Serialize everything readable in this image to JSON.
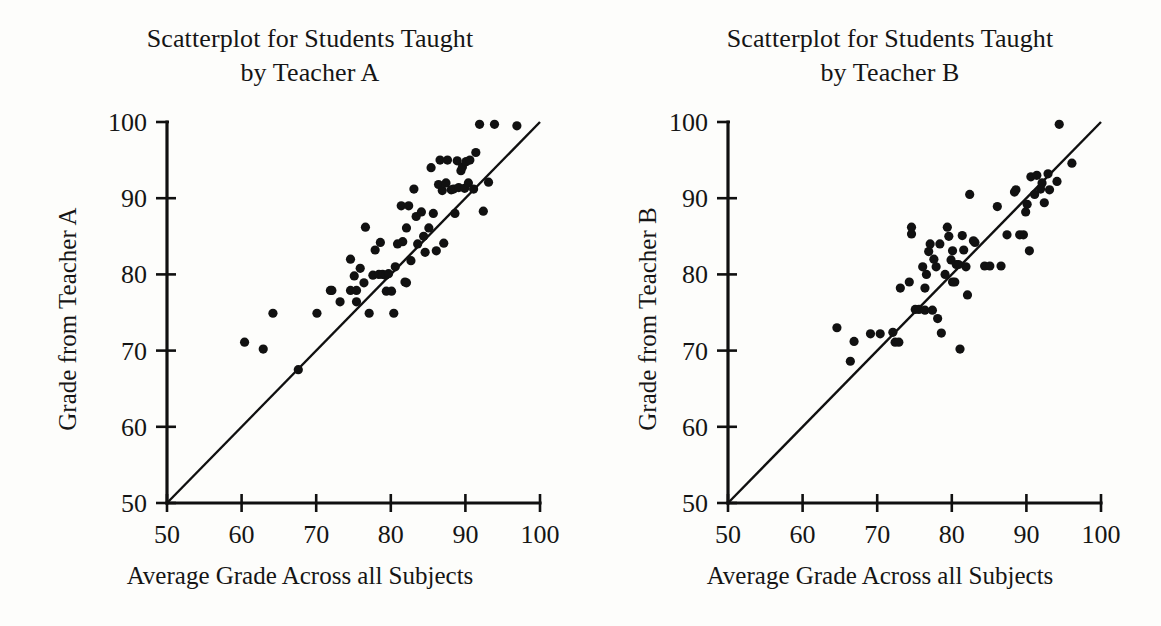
{
  "figure": {
    "background_color": "#fdfdfb",
    "ink_color": "#111111"
  },
  "panels": [
    {
      "id": "teacher-a",
      "title_line1": "Scatterplot for Students Taught",
      "title_line2": "by Teacher A",
      "xlabel": "Average Grade Across all Subjects",
      "ylabel": "Grade from Teacher A"
    },
    {
      "id": "teacher-b",
      "title_line1": "Scatterplot for Students Taught",
      "title_line2": "by Teacher B",
      "xlabel": "Average Grade Across all Subjects",
      "ylabel": "Grade from Teacher B"
    }
  ],
  "chart_data": [
    {
      "type": "scatter",
      "title": "Scatterplot for Students Taught by Teacher A",
      "xlabel": "Average Grade Across all Subjects",
      "ylabel": "Grade from Teacher A",
      "xlim": [
        50,
        100
      ],
      "ylim": [
        50,
        100
      ],
      "xticks": [
        50,
        60,
        70,
        80,
        90,
        100
      ],
      "yticks": [
        50,
        60,
        70,
        80,
        90,
        100
      ],
      "xticklabels": [
        "50",
        "60",
        "70",
        "80",
        "90",
        "100"
      ],
      "yticklabels": [
        "50",
        "60",
        "70",
        "80",
        "90",
        "100"
      ],
      "grid": false,
      "legend": false,
      "reference_line": {
        "label": "y = x identity line",
        "from": [
          50,
          50
        ],
        "to": [
          100,
          100
        ]
      },
      "points": [
        [
          60.4,
          71.1
        ],
        [
          62.9,
          70.2
        ],
        [
          64.2,
          74.9
        ],
        [
          67.6,
          67.5
        ],
        [
          70.1,
          74.9
        ],
        [
          72.1,
          77.9
        ],
        [
          73.2,
          76.4
        ],
        [
          74.6,
          77.9
        ],
        [
          74.6,
          82.0
        ],
        [
          75.4,
          77.9
        ],
        [
          75.4,
          76.4
        ],
        [
          75.9,
          80.8
        ],
        [
          76.4,
          78.9
        ],
        [
          76.6,
          86.2
        ],
        [
          77.1,
          74.9
        ],
        [
          77.6,
          79.9
        ],
        [
          77.9,
          83.2
        ],
        [
          78.4,
          80.0
        ],
        [
          78.6,
          84.2
        ],
        [
          78.9,
          80.0
        ],
        [
          79.3,
          79.9
        ],
        [
          79.4,
          77.8
        ],
        [
          79.7,
          80.1
        ],
        [
          80.1,
          77.8
        ],
        [
          80.4,
          74.9
        ],
        [
          80.6,
          81.0
        ],
        [
          81.4,
          89.0
        ],
        [
          81.6,
          84.3
        ],
        [
          81.9,
          79.0
        ],
        [
          82.1,
          86.1
        ],
        [
          82.4,
          89.0
        ],
        [
          82.7,
          81.8
        ],
        [
          83.1,
          91.2
        ],
        [
          83.4,
          87.6
        ],
        [
          83.6,
          84.0
        ],
        [
          84.1,
          88.2
        ],
        [
          84.4,
          85.0
        ],
        [
          84.6,
          82.9
        ],
        [
          85.1,
          86.1
        ],
        [
          85.4,
          94.0
        ],
        [
          85.7,
          88.0
        ],
        [
          86.1,
          83.1
        ],
        [
          86.4,
          91.8
        ],
        [
          86.6,
          95.0
        ],
        [
          86.9,
          91.0
        ],
        [
          87.1,
          84.1
        ],
        [
          87.4,
          92.0
        ],
        [
          87.6,
          95.0
        ],
        [
          88.1,
          91.1
        ],
        [
          88.4,
          91.2
        ],
        [
          88.6,
          88.0
        ],
        [
          88.9,
          94.9
        ],
        [
          89.1,
          91.4
        ],
        [
          89.4,
          93.6
        ],
        [
          89.6,
          94.1
        ],
        [
          89.9,
          91.3
        ],
        [
          90.1,
          94.8
        ],
        [
          90.4,
          92.0
        ],
        [
          90.6,
          95.0
        ],
        [
          91.1,
          91.2
        ],
        [
          91.4,
          96.0
        ],
        [
          91.9,
          99.7
        ],
        [
          92.4,
          88.3
        ],
        [
          93.1,
          92.1
        ],
        [
          93.9,
          99.7
        ],
        [
          96.9,
          99.5
        ],
        [
          82.1,
          78.9
        ],
        [
          80.9,
          84.0
        ],
        [
          75.1,
          79.8
        ],
        [
          71.9,
          77.9
        ]
      ]
    },
    {
      "type": "scatter",
      "title": "Scatterplot for Students Taught by Teacher B",
      "xlabel": "Average Grade Across all Subjects",
      "ylabel": "Grade from Teacher B",
      "xlim": [
        50,
        100
      ],
      "ylim": [
        50,
        100
      ],
      "xticks": [
        50,
        60,
        70,
        80,
        90,
        100
      ],
      "yticks": [
        50,
        60,
        70,
        80,
        90,
        100
      ],
      "xticklabels": [
        "50",
        "60",
        "70",
        "80",
        "90",
        "100"
      ],
      "yticklabels": [
        "50",
        "60",
        "70",
        "80",
        "90",
        "100"
      ],
      "grid": false,
      "legend": false,
      "reference_line": {
        "label": "y = x identity line",
        "from": [
          50,
          50
        ],
        "to": [
          100,
          100
        ]
      },
      "points": [
        [
          64.6,
          73.0
        ],
        [
          66.4,
          68.6
        ],
        [
          66.9,
          71.2
        ],
        [
          69.1,
          72.2
        ],
        [
          70.4,
          72.2
        ],
        [
          72.1,
          72.4
        ],
        [
          72.4,
          71.1
        ],
        [
          72.9,
          71.1
        ],
        [
          73.1,
          78.2
        ],
        [
          74.3,
          79.0
        ],
        [
          74.6,
          86.2
        ],
        [
          74.6,
          85.3
        ],
        [
          75.1,
          75.4
        ],
        [
          75.6,
          75.4
        ],
        [
          76.1,
          81.0
        ],
        [
          76.4,
          75.3
        ],
        [
          76.4,
          78.2
        ],
        [
          76.6,
          80.0
        ],
        [
          76.9,
          83.0
        ],
        [
          77.1,
          84.0
        ],
        [
          77.4,
          75.3
        ],
        [
          77.6,
          82.0
        ],
        [
          77.9,
          81.0
        ],
        [
          78.1,
          74.2
        ],
        [
          78.4,
          84.0
        ],
        [
          78.6,
          72.3
        ],
        [
          79.1,
          80.0
        ],
        [
          79.4,
          86.2
        ],
        [
          79.6,
          85.0
        ],
        [
          79.9,
          81.9
        ],
        [
          80.1,
          79.0
        ],
        [
          80.4,
          79.0
        ],
        [
          80.6,
          81.3
        ],
        [
          80.9,
          81.3
        ],
        [
          81.1,
          70.2
        ],
        [
          81.4,
          85.1
        ],
        [
          81.6,
          83.2
        ],
        [
          81.9,
          81.0
        ],
        [
          82.1,
          77.3
        ],
        [
          82.4,
          90.5
        ],
        [
          83.1,
          84.2
        ],
        [
          84.4,
          81.1
        ],
        [
          85.1,
          81.1
        ],
        [
          86.1,
          88.9
        ],
        [
          87.4,
          85.2
        ],
        [
          88.4,
          90.8
        ],
        [
          88.6,
          91.1
        ],
        [
          89.1,
          85.2
        ],
        [
          89.6,
          85.2
        ],
        [
          89.9,
          88.2
        ],
        [
          90.1,
          89.2
        ],
        [
          90.4,
          83.1
        ],
        [
          90.6,
          92.8
        ],
        [
          91.1,
          90.5
        ],
        [
          91.4,
          93.0
        ],
        [
          91.9,
          91.2
        ],
        [
          92.1,
          92.0
        ],
        [
          92.4,
          89.4
        ],
        [
          92.9,
          93.2
        ],
        [
          93.1,
          91.1
        ],
        [
          94.1,
          92.2
        ],
        [
          94.4,
          99.7
        ],
        [
          96.1,
          94.6
        ],
        [
          82.9,
          84.4
        ],
        [
          86.6,
          81.1
        ],
        [
          80.1,
          83.1
        ]
      ]
    }
  ]
}
